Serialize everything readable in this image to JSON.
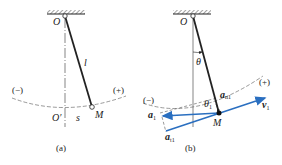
{
  "figure_a": {
    "pivot_label": "O",
    "length_label": "l",
    "neg_label": "(−)",
    "pos_label": "(+)",
    "origin_label": "O′",
    "arc_label": "s",
    "mass_label": "M",
    "caption": "(a)"
  },
  "figure_b": {
    "pivot_label": "O",
    "angle_label": "θ",
    "neg_label": "(−)",
    "pos_label": "(+)",
    "anl_main": "a",
    "anl_sub": "n1",
    "theta1_main": "θ",
    "theta1_sub": "1",
    "a1_main": "a",
    "a1_sub": "1",
    "at1_main": "a",
    "at1_sub": "t1",
    "v1_main": "v",
    "v1_sub": "1",
    "mass_label": "M",
    "caption": "(b)"
  },
  "colors": {
    "vector_blue": "#2a6fc0",
    "line": "#222222"
  }
}
